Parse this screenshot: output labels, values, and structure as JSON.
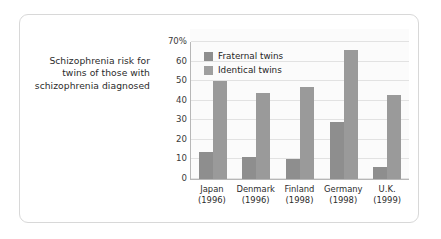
{
  "caption": {
    "text": "Schizophrenia risk for twins of those with schizophrenia diagnosed"
  },
  "legend": {
    "position": "top-left-inside",
    "items": [
      {
        "label": "Fraternal twins",
        "color": "#8e8e8e",
        "swatch": "legend-swatch"
      },
      {
        "label": "Identical twins",
        "color": "#9f9f9f",
        "swatch": "legend-swatch"
      }
    ]
  },
  "axis": {
    "y_ticks": [
      "0",
      "10",
      "20",
      "30",
      "40",
      "50",
      "60",
      "70%"
    ]
  },
  "chart_data": {
    "type": "bar",
    "title": "",
    "xlabel": "",
    "ylabel": "",
    "ylim": [
      0,
      70
    ],
    "ytick_step": 10,
    "grid": true,
    "legend_position": "top-left-inside",
    "categories": [
      "Japan",
      "Denmark",
      "Finland",
      "Germany",
      "U.K."
    ],
    "category_years": [
      "(1996)",
      "(1996)",
      "(1998)",
      "(1998)",
      "(1999)"
    ],
    "series": [
      {
        "name": "Fraternal twins",
        "color": "#8e8e8e",
        "values": [
          14,
          11,
          10,
          29,
          6
        ]
      },
      {
        "name": "Identical twins",
        "color": "#9a9a9a",
        "values": [
          50,
          44,
          47,
          66,
          43
        ]
      }
    ]
  }
}
